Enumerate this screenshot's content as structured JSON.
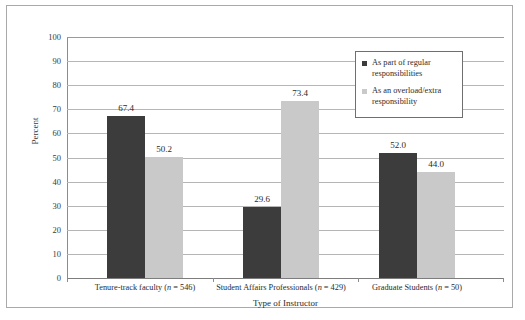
{
  "chart_data": {
    "type": "bar",
    "title": "",
    "xlabel": "Type of Instructor",
    "ylabel": "Percent",
    "ylim": [
      0,
      100
    ],
    "ytick_step": 10,
    "yticks": [
      "100",
      "90",
      "80",
      "70",
      "60",
      "50",
      "40",
      "30",
      "20",
      "10",
      "0"
    ],
    "grid": true,
    "legend_position": "top-right",
    "categories": [
      "Tenure-track faculty (n = 546)",
      "Student Affairs Professionals (n = 429)",
      "Graduate Students (n = 50)"
    ],
    "category_parts": [
      {
        "name": "Tenure-track faculty",
        "n_prefix": " (",
        "n_italic": "n",
        "n_suffix": " = 546)"
      },
      {
        "name": "Student Affairs Professionals",
        "n_prefix": " (",
        "n_italic": "n",
        "n_suffix": " = 429)"
      },
      {
        "name": "Graduate Students",
        "n_prefix": " (",
        "n_italic": "n",
        "n_suffix": " = 50)"
      }
    ],
    "series": [
      {
        "name": "As part of regular responsibilities",
        "color": "#3c3c3c",
        "values": [
          67.4,
          50.2,
          29.6
        ],
        "labels": [
          "67.4",
          "29.6",
          "52.0"
        ]
      },
      {
        "name": "As an overload/extra responsibility",
        "color": "#c9c9c9",
        "values": [
          50.2,
          73.4,
          44.0
        ],
        "labels": [
          "50.2",
          "73.4",
          "44.0"
        ]
      }
    ],
    "data_by_category": [
      {
        "category": "Tenure-track faculty (n = 546)",
        "regular": 67.4,
        "overload": 50.2
      },
      {
        "category": "Student Affairs Professionals (n = 429)",
        "regular": 29.6,
        "overload": 73.4
      },
      {
        "category": "Graduate Students (n = 50)",
        "regular": 52.0,
        "overload": 44.0
      }
    ]
  },
  "legend": {
    "items": [
      {
        "label_line1": "As part of regular",
        "label_line2": "responsibilities",
        "color": "#3c3c3c"
      },
      {
        "label_line1": "As an overload/extra",
        "label_line2": "responsibility",
        "color": "#c9c9c9"
      }
    ]
  },
  "axis": {
    "y_title": "Percent",
    "x_title": "Type of Instructor"
  }
}
